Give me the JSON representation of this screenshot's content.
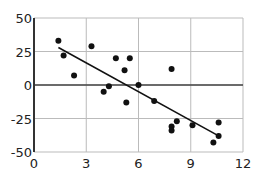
{
  "chart_data": {
    "type": "scatter",
    "title": "",
    "xlabel": "",
    "ylabel": "",
    "xlim": [
      0,
      12
    ],
    "ylim": [
      -50,
      50
    ],
    "xticks": [
      0,
      3,
      6,
      9,
      12
    ],
    "yticks": [
      50,
      25,
      0,
      -25,
      -50
    ],
    "xtick_labels": [
      "0",
      "3",
      "6",
      "9",
      "12"
    ],
    "ytick_labels": [
      "50",
      "25",
      "0",
      "-25",
      "-50"
    ],
    "grid": true,
    "legend": null,
    "series": [
      {
        "name": "points",
        "x": [
          1.4,
          1.7,
          2.3,
          3.3,
          4.0,
          4.3,
          4.7,
          5.2,
          5.5,
          5.3,
          6.0,
          6.9,
          7.9,
          8.2,
          7.9,
          7.9,
          9.1,
          10.6,
          10.6,
          10.3
        ],
        "y": [
          33,
          22,
          7,
          29,
          -5,
          -1,
          20,
          11,
          20,
          -13,
          0,
          -12,
          12,
          -27,
          -31,
          -34,
          -30,
          -28,
          -38,
          -43
        ]
      }
    ],
    "trend_line": {
      "x": [
        1.4,
        10.6
      ],
      "y": [
        28,
        -38
      ]
    },
    "colors": {
      "points": "#111111",
      "line": "#111111",
      "grid": "#bbbbbb",
      "axis": "#333333",
      "zero_line": "#444444"
    }
  }
}
